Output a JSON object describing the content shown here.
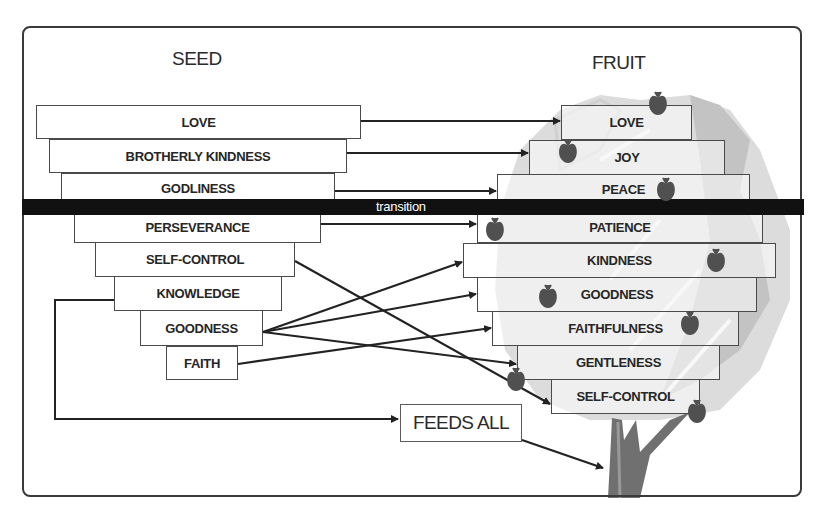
{
  "diagram": {
    "seed_title": "SEED",
    "fruit_title": "FRUIT",
    "transition_label": "transition",
    "feeds_label": "FEEDS ALL",
    "seed": [
      {
        "label": "LOVE"
      },
      {
        "label": "BROTHERLY KINDNESS"
      },
      {
        "label": "GODLINESS"
      },
      {
        "label": "PERSEVERANCE"
      },
      {
        "label": "SELF-CONTROL"
      },
      {
        "label": "KNOWLEDGE"
      },
      {
        "label": "GOODNESS"
      },
      {
        "label": "FAITH"
      }
    ],
    "fruit": [
      {
        "label": "LOVE"
      },
      {
        "label": "JOY"
      },
      {
        "label": "PEACE"
      },
      {
        "label": "PATIENCE"
      },
      {
        "label": "KINDNESS"
      },
      {
        "label": "GOODNESS"
      },
      {
        "label": "FAITHFULNESS"
      },
      {
        "label": "GENTLENESS"
      },
      {
        "label": "SELF-CONTROL"
      }
    ],
    "connections": [
      {
        "from": "LOVE",
        "to": "LOVE"
      },
      {
        "from": "BROTHERLY KINDNESS",
        "to": "JOY"
      },
      {
        "from": "GODLINESS",
        "to": "PEACE"
      },
      {
        "from": "PERSEVERANCE",
        "to": "PATIENCE"
      },
      {
        "from": "SELF-CONTROL",
        "to": "SELF-CONTROL"
      },
      {
        "from": "GOODNESS",
        "to": "KINDNESS"
      },
      {
        "from": "GOODNESS",
        "to": "GOODNESS"
      },
      {
        "from": "GOODNESS",
        "to": "GENTLENESS"
      },
      {
        "from": "FAITH",
        "to": "FAITHFULNESS"
      },
      {
        "from": "KNOWLEDGE",
        "to": "FEEDS ALL"
      },
      {
        "from": "FEEDS ALL",
        "to": "tree-trunk"
      }
    ],
    "colors": {
      "bar": "#111111",
      "apple": "#4a4a4a",
      "tree": "#bdbdbd",
      "trunk": "#6e6e6e"
    }
  }
}
